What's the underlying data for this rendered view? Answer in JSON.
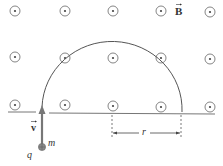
{
  "labels": {
    "field": "B",
    "velocity": "v",
    "mass": "m",
    "charge": "q",
    "radius": "r"
  },
  "field_direction": "out-of-page",
  "field_symbols": {
    "rows_y": [
      11,
      58,
      107
    ],
    "cols_x": [
      15,
      65,
      113,
      161,
      210
    ]
  },
  "colors": {
    "line": "#666666",
    "arrow": "#777777",
    "particle": "#8a8a8a"
  }
}
